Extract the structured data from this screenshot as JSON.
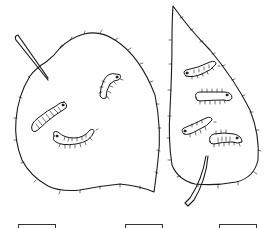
{
  "worksheet": {
    "description": "Two leaves with caterpillars; count caterpillars on each",
    "colors": {
      "line": "#1a1a1a",
      "background": "#ffffff"
    },
    "left_leaf": {
      "shape": "round-heart",
      "caterpillar_count": 3
    },
    "right_leaf": {
      "shape": "narrow-pointed",
      "caterpillar_count": 4
    },
    "answer_boxes": [
      {
        "value": ""
      },
      {
        "value": ""
      },
      {
        "value": ""
      }
    ]
  }
}
